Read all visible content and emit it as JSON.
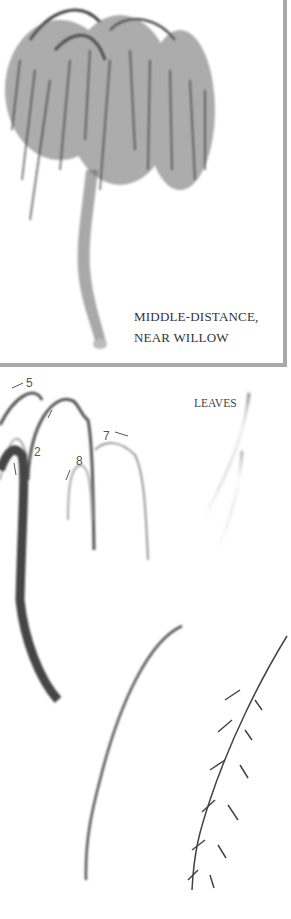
{
  "illustration": {
    "top_panel": {
      "caption_lines": [
        "MIDDLE-DISTANCE,",
        "NEAR WILLOW"
      ],
      "frame_color": "#a9a9a9"
    },
    "stroke_diagram": {
      "stroke_numbers": [
        "5",
        "2",
        "7",
        "8"
      ],
      "leaves_label": "LEAVES"
    },
    "ink_color": "#3a3a3a"
  }
}
